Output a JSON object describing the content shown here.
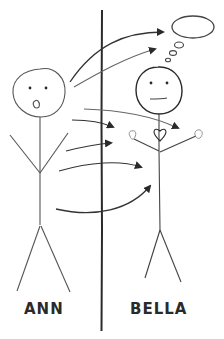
{
  "figure": {
    "type": "hand-drawn diagram",
    "left_person": {
      "name": "ANN",
      "expression": "surprised (open mouth)"
    },
    "right_person": {
      "name": "BELLA",
      "expression": "neutral",
      "features": [
        "thought-bubble",
        "heart"
      ]
    },
    "divider": "vertical line separating the two figures",
    "arrows": [
      {
        "from": "Ann head",
        "to": "Bella thought bubble"
      },
      {
        "from": "Ann head",
        "to": "Bella thought bubble (lower)"
      },
      {
        "from": "Ann",
        "to": "Bella heart"
      },
      {
        "from": "Ann",
        "to": "across divider"
      },
      {
        "from": "Ann",
        "to": "across divider"
      },
      {
        "from": "Ann",
        "to": "Bella body"
      },
      {
        "from": "Ann",
        "to": "Bella body (lower)"
      }
    ],
    "colors": {
      "ink": "#2a2a2a",
      "light_ink": "#777777",
      "background": "#ffffff"
    }
  }
}
